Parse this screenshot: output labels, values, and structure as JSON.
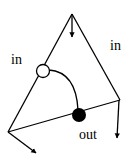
{
  "diagram": {
    "labels": {
      "in_left": "in",
      "in_right": "in",
      "out": "out"
    },
    "colors": {
      "stroke": "#000000",
      "background": "#ffffff",
      "open_node_fill": "#ffffff",
      "filled_node_fill": "#000000"
    }
  }
}
